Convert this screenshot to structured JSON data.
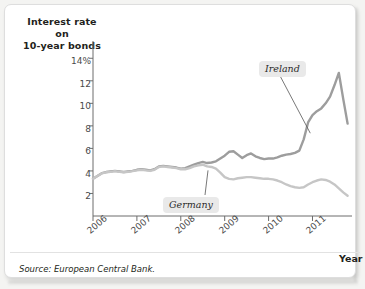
{
  "figure": {
    "title": "Interest rate on\n10-year bonds",
    "title_line1": "Interest rate on",
    "title_line2": "10-year bonds",
    "source": "Source: European Central Bank.",
    "x_axis_title": "Year"
  },
  "colors": {
    "ireland_line": "#9d9d9d",
    "germany_line": "#c6c6c6",
    "axis": "#6d6d6d",
    "text": "#231f20",
    "callout_bg": "#e9e9e9",
    "card_bg": "#ffffff",
    "page_bg": "#f4f4f2"
  },
  "chart_data": {
    "type": "line",
    "title": "Interest rate on 10-year bonds",
    "xlabel": "Year",
    "ylabel": "Interest rate on 10-year bonds",
    "ylim": [
      0,
      15
    ],
    "xlim": [
      2006,
      2011.9
    ],
    "grid": false,
    "legend": "annotations",
    "ytick_labels": [
      "2",
      "4",
      "6",
      "8",
      "10",
      "12",
      "14%"
    ],
    "ytick_values": [
      2,
      4,
      6,
      8,
      10,
      12,
      14
    ],
    "xtick_labels": [
      "2006",
      "2007",
      "2008",
      "2009",
      "2010",
      "2011"
    ],
    "xtick_values": [
      2006,
      2007,
      2008,
      2009,
      2010,
      2011
    ],
    "annotations": [
      {
        "text": "Ireland",
        "series": "Ireland",
        "x": 2010.55,
        "y": 11.9
      },
      {
        "text": "Germany",
        "series": "Germany",
        "x": 2008.75,
        "y": 1.55
      }
    ],
    "series": [
      {
        "name": "Ireland",
        "color": "#9d9d9d",
        "x": [
          2006.0,
          2006.1,
          2006.2,
          2006.3,
          2006.4,
          2006.5,
          2006.6,
          2006.7,
          2006.8,
          2006.9,
          2007.0,
          2007.1,
          2007.2,
          2007.3,
          2007.4,
          2007.5,
          2007.6,
          2007.7,
          2007.8,
          2007.9,
          2008.0,
          2008.1,
          2008.2,
          2008.3,
          2008.4,
          2008.5,
          2008.6,
          2008.7,
          2008.8,
          2008.9,
          2009.0,
          2009.1,
          2009.2,
          2009.3,
          2009.4,
          2009.5,
          2009.6,
          2009.7,
          2009.8,
          2009.9,
          2010.0,
          2010.1,
          2010.2,
          2010.3,
          2010.4,
          2010.5,
          2010.6,
          2010.7,
          2010.8,
          2010.9,
          2011.0,
          2011.1,
          2011.2,
          2011.3,
          2011.4,
          2011.5,
          2011.6,
          2011.7,
          2011.8
        ],
        "y": [
          3.3,
          3.55,
          3.8,
          3.9,
          3.95,
          4.0,
          3.95,
          3.9,
          3.95,
          4.0,
          4.1,
          4.15,
          4.1,
          4.05,
          4.15,
          4.4,
          4.45,
          4.4,
          4.35,
          4.3,
          4.2,
          4.25,
          4.4,
          4.55,
          4.7,
          4.8,
          4.7,
          4.75,
          4.85,
          5.1,
          5.35,
          5.7,
          5.75,
          5.45,
          5.15,
          5.4,
          5.55,
          5.3,
          5.15,
          5.05,
          5.1,
          5.1,
          5.2,
          5.35,
          5.45,
          5.5,
          5.6,
          5.8,
          6.8,
          8.3,
          8.95,
          9.3,
          9.55,
          10.0,
          10.6,
          11.6,
          12.7,
          10.4,
          8.2
        ]
      },
      {
        "name": "Germany",
        "color": "#c6c6c6",
        "x": [
          2006.0,
          2006.1,
          2006.2,
          2006.3,
          2006.4,
          2006.5,
          2006.6,
          2006.7,
          2006.8,
          2006.9,
          2007.0,
          2007.1,
          2007.2,
          2007.3,
          2007.4,
          2007.5,
          2007.6,
          2007.7,
          2007.8,
          2007.9,
          2008.0,
          2008.1,
          2008.2,
          2008.3,
          2008.4,
          2008.5,
          2008.6,
          2008.7,
          2008.8,
          2008.9,
          2009.0,
          2009.1,
          2009.2,
          2009.3,
          2009.4,
          2009.5,
          2009.6,
          2009.7,
          2009.8,
          2009.9,
          2010.0,
          2010.1,
          2010.2,
          2010.3,
          2010.4,
          2010.5,
          2010.6,
          2010.7,
          2010.8,
          2010.9,
          2011.0,
          2011.1,
          2011.2,
          2011.3,
          2011.4,
          2011.5,
          2011.6,
          2011.7,
          2011.8
        ],
        "y": [
          3.3,
          3.55,
          3.78,
          3.88,
          3.92,
          3.98,
          3.92,
          3.88,
          3.92,
          3.98,
          4.05,
          4.1,
          4.05,
          4.0,
          4.1,
          4.35,
          4.4,
          4.35,
          4.3,
          4.25,
          4.15,
          4.15,
          4.25,
          4.4,
          4.5,
          4.55,
          4.4,
          4.35,
          4.2,
          3.85,
          3.45,
          3.3,
          3.25,
          3.35,
          3.4,
          3.45,
          3.45,
          3.4,
          3.35,
          3.3,
          3.3,
          3.25,
          3.15,
          3.0,
          2.8,
          2.65,
          2.55,
          2.5,
          2.55,
          2.8,
          3.0,
          3.15,
          3.25,
          3.2,
          3.05,
          2.8,
          2.45,
          2.1,
          1.8
        ]
      }
    ]
  }
}
